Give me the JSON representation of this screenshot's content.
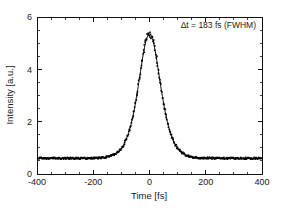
{
  "chart_data": {
    "type": "scatter",
    "title": "",
    "xlabel": "Time [fs]",
    "ylabel": "Intensity [a.u.]",
    "xlim": [
      -400,
      400
    ],
    "ylim": [
      0,
      6
    ],
    "grid": false,
    "legend": null,
    "xticks": [
      -400,
      -200,
      0,
      200,
      400
    ],
    "xtick_labels": [
      "-400",
      "-200",
      "0",
      "200",
      "400"
    ],
    "xminor_step": 50,
    "yticks": [
      0,
      2,
      4,
      6
    ],
    "ytick_labels": [
      "0",
      "2",
      "4",
      "6"
    ],
    "yminor_step": 0.5,
    "annotations": [
      {
        "text": "Δt = 183 fs (FWHM)",
        "x": 255,
        "y": 5.72,
        "align": "right"
      }
    ],
    "series": [
      {
        "name": "Autocorrelation data",
        "style": "points",
        "marker": "square",
        "color": "#000000",
        "x": [
          -400,
          -392,
          -384,
          -376,
          -368,
          -360,
          -352,
          -344,
          -336,
          -328,
          -320,
          -312,
          -304,
          -296,
          -288,
          -280,
          -272,
          -264,
          -256,
          -248,
          -240,
          -232,
          -224,
          -216,
          -208,
          -200,
          -192,
          -184,
          -176,
          -168,
          -160,
          -152,
          -144,
          -136,
          -128,
          -120,
          -112,
          -104,
          -96,
          -88,
          -80,
          -72,
          -64,
          -56,
          -48,
          -40,
          -32,
          -24,
          -16,
          -8,
          0,
          8,
          16,
          24,
          32,
          40,
          48,
          56,
          64,
          72,
          80,
          88,
          96,
          104,
          112,
          120,
          128,
          136,
          144,
          152,
          160,
          168,
          176,
          184,
          192,
          200,
          208,
          216,
          224,
          232,
          240,
          248,
          256,
          264,
          272,
          280,
          288,
          296,
          304,
          312,
          320,
          328,
          336,
          344,
          352,
          360,
          368,
          376,
          384,
          392,
          400
        ],
        "y": [
          0.6,
          0.61,
          0.62,
          0.63,
          0.65,
          0.67,
          0.69,
          0.71,
          0.74,
          0.77,
          0.8,
          0.84,
          0.88,
          0.92,
          0.97,
          1.02,
          1.08,
          1.14,
          1.21,
          1.29,
          1.37,
          1.46,
          1.56,
          1.67,
          1.78,
          1.91,
          2.04,
          2.18,
          2.33,
          2.48,
          2.65,
          2.82,
          2.99,
          3.17,
          3.35,
          3.54,
          3.72,
          3.9,
          4.08,
          4.25,
          4.42,
          4.57,
          4.72,
          4.85,
          4.97,
          5.07,
          5.16,
          5.23,
          5.29,
          5.33,
          5.35,
          5.34,
          5.32,
          5.28,
          5.22,
          5.14,
          5.05,
          4.94,
          4.82,
          4.68,
          4.53,
          4.38,
          4.21,
          4.04,
          3.86,
          3.68,
          3.5,
          3.31,
          3.13,
          2.95,
          2.78,
          2.61,
          2.45,
          2.29,
          2.15,
          2.01,
          1.88,
          1.76,
          1.65,
          1.55,
          1.45,
          1.36,
          1.28,
          1.21,
          1.14,
          1.08,
          1.02,
          0.97,
          0.92,
          0.88,
          0.84,
          0.81,
          0.78,
          0.75,
          0.72,
          0.7,
          0.68,
          0.66,
          0.64,
          0.63,
          0.61
        ]
      },
      {
        "name": "Fit curve",
        "style": "line",
        "color": "#0a0a0a",
        "description": "sech-squared fit to autocorrelation data, peak 5.35 at t=0, baseline 0.60, FWHM 183 fs"
      }
    ]
  },
  "axes": {
    "x_title": "Time [fs]",
    "y_title": "Intensity [a.u.]"
  },
  "annotation": {
    "label": "Δt = 183 fs (FWHM)"
  },
  "colors": {
    "background": "#ffffff",
    "axis": "#111111",
    "data": "#000000",
    "text": "#1a1a1a"
  }
}
